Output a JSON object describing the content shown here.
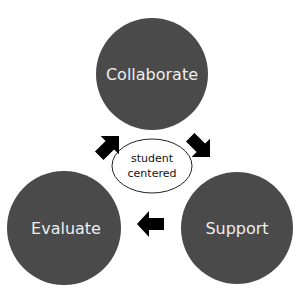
{
  "diagram": {
    "type": "cycle",
    "nodes": [
      {
        "id": "collaborate",
        "label": "Collaborate",
        "cx": 152,
        "cy": 74,
        "r": 56
      },
      {
        "id": "support",
        "label": "Support",
        "cx": 237,
        "cy": 228,
        "r": 56
      },
      {
        "id": "evaluate",
        "label": "Evaluate",
        "cx": 64,
        "cy": 228,
        "r": 57
      }
    ],
    "center": {
      "line1": "student",
      "line2": "centered"
    },
    "edges": [
      {
        "from": "collaborate",
        "to": "support"
      },
      {
        "from": "support",
        "to": "evaluate"
      },
      {
        "from": "evaluate",
        "to": "collaborate"
      }
    ],
    "colors": {
      "node_fill": "#4a4a4a",
      "node_text": "#eeeeee",
      "arrow": "#000000",
      "center_stroke": "#222222"
    }
  }
}
